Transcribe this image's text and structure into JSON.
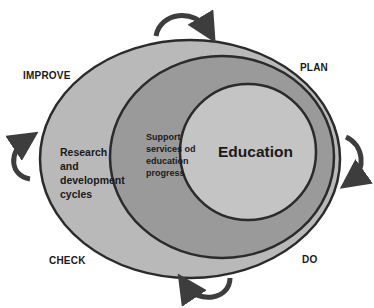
{
  "diagram": {
    "type": "nested-cycle",
    "phases": {
      "plan": "PLAN",
      "do": "DO",
      "check": "CHECK",
      "improve": "IMPROVE"
    },
    "rings": {
      "outer": {
        "label_lines": [
          "Research",
          "and",
          "development",
          "cycles"
        ],
        "fill": "#b9b9b9"
      },
      "middle": {
        "label_lines": [
          "Support",
          "services od",
          "education",
          "progress"
        ],
        "fill": "#9a9a9a"
      },
      "inner": {
        "label": "Education",
        "fill": "#c4c4c4"
      }
    },
    "stroke_color": "#2b2b2b",
    "arrow_color": "#3d3d3d",
    "arrows": [
      "top-clockwise",
      "right-clockwise",
      "bottom-clockwise",
      "left-clockwise"
    ]
  }
}
